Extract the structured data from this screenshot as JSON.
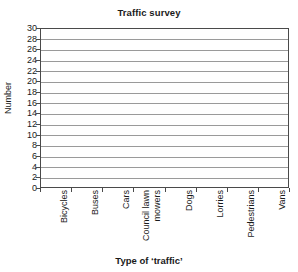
{
  "chart_data": {
    "type": "bar",
    "title": "Traffic survey",
    "xlabel": "Type of ‘traffic’",
    "ylabel": "Number",
    "categories": [
      "Bicycles",
      "Buses",
      "Cars",
      "Council lawn mowers",
      "Dogs",
      "Lorries",
      "Pedestrians",
      "Vans"
    ],
    "category_lines": [
      [
        "Bicycles"
      ],
      [
        "Buses"
      ],
      [
        "Cars"
      ],
      [
        "Council lawn",
        "mowers"
      ],
      [
        "Dogs"
      ],
      [
        "Lorries"
      ],
      [
        "Pedestrians"
      ],
      [
        "Vans"
      ]
    ],
    "values": [
      null,
      null,
      null,
      null,
      null,
      null,
      null,
      null
    ],
    "ylim": [
      0,
      30
    ],
    "ytick_step": 2,
    "yticks": [
      30,
      28,
      26,
      24,
      22,
      20,
      18,
      16,
      14,
      12,
      10,
      8,
      6,
      4,
      2,
      0
    ],
    "grid": "horizontal",
    "legend": null
  },
  "style": {
    "grid_color": "#9a9a9a",
    "axis_color": "#4a4a4a",
    "text_color": "#1a1a1a",
    "background": "#ffffff"
  }
}
